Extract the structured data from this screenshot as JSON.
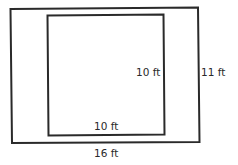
{
  "diagram": {
    "type": "nested-rectangles",
    "outer_rectangle": {
      "width_label": "16 ft",
      "height_label": "11 ft"
    },
    "inner_square": {
      "width_label": "10 ft",
      "height_label": "10 ft"
    },
    "colors": {
      "stroke": "#2a2a2a",
      "background": "#ffffff"
    }
  }
}
